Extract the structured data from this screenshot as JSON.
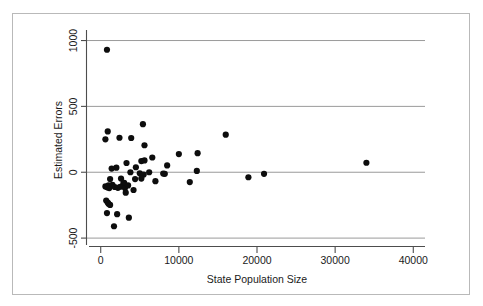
{
  "chart_data": {
    "type": "scatter",
    "title": "",
    "xlabel": "State Population Size",
    "ylabel": "Estimated Errors",
    "xlim": [
      -1500,
      41500
    ],
    "ylim": [
      -560,
      1080
    ],
    "xticks": [
      0,
      10000,
      20000,
      30000,
      40000
    ],
    "xtick_labels": [
      "0",
      "10000",
      "20000",
      "30000",
      "40000"
    ],
    "yticks": [
      -500,
      0,
      500,
      1000
    ],
    "ytick_labels": [
      "-500",
      "0",
      "500",
      "1000"
    ],
    "grid": "horizontal",
    "gridlines": [
      -500,
      0,
      500,
      1000
    ],
    "legend": "none",
    "marker": "filled-circle",
    "marker_color": "#0d0d0d",
    "points": [
      {
        "x": 800,
        "y": 930
      },
      {
        "x": 900,
        "y": 310
      },
      {
        "x": 600,
        "y": 250
      },
      {
        "x": 2400,
        "y": 262
      },
      {
        "x": 3900,
        "y": 260
      },
      {
        "x": 5400,
        "y": 365
      },
      {
        "x": 5600,
        "y": 205
      },
      {
        "x": 16000,
        "y": 285
      },
      {
        "x": 34000,
        "y": 72
      },
      {
        "x": 10000,
        "y": 138
      },
      {
        "x": 12400,
        "y": 145
      },
      {
        "x": 6600,
        "y": 112
      },
      {
        "x": 5600,
        "y": 90
      },
      {
        "x": 5200,
        "y": 85
      },
      {
        "x": 8500,
        "y": 52
      },
      {
        "x": 2000,
        "y": 35
      },
      {
        "x": 3300,
        "y": 70
      },
      {
        "x": 4500,
        "y": 38
      },
      {
        "x": 1400,
        "y": 28
      },
      {
        "x": 12300,
        "y": 10
      },
      {
        "x": 3800,
        "y": 0
      },
      {
        "x": 6200,
        "y": 0
      },
      {
        "x": 5000,
        "y": -8
      },
      {
        "x": 8200,
        "y": -12
      },
      {
        "x": 8000,
        "y": -10
      },
      {
        "x": 5500,
        "y": -18
      },
      {
        "x": 20900,
        "y": -12
      },
      {
        "x": 18900,
        "y": -38
      },
      {
        "x": 5200,
        "y": -48
      },
      {
        "x": 1200,
        "y": -52
      },
      {
        "x": 2600,
        "y": -48
      },
      {
        "x": 4400,
        "y": -52
      },
      {
        "x": 7000,
        "y": -68
      },
      {
        "x": 11400,
        "y": -75
      },
      {
        "x": 3000,
        "y": -80
      },
      {
        "x": 2900,
        "y": -85
      },
      {
        "x": 600,
        "y": -108
      },
      {
        "x": 800,
        "y": -112
      },
      {
        "x": 900,
        "y": -115
      },
      {
        "x": 1000,
        "y": -100
      },
      {
        "x": 1100,
        "y": -120
      },
      {
        "x": 1500,
        "y": -95
      },
      {
        "x": 1800,
        "y": -112
      },
      {
        "x": 2200,
        "y": -118
      },
      {
        "x": 2500,
        "y": -110
      },
      {
        "x": 3100,
        "y": -120
      },
      {
        "x": 3500,
        "y": -100
      },
      {
        "x": 4200,
        "y": -135
      },
      {
        "x": 3200,
        "y": -155
      },
      {
        "x": 700,
        "y": -215
      },
      {
        "x": 900,
        "y": -230
      },
      {
        "x": 1000,
        "y": -240
      },
      {
        "x": 1200,
        "y": -248
      },
      {
        "x": 800,
        "y": -310
      },
      {
        "x": 2100,
        "y": -318
      },
      {
        "x": 3600,
        "y": -345
      },
      {
        "x": 1700,
        "y": -410
      }
    ]
  },
  "axes": {
    "xlabel": "State Population Size",
    "ylabel": "Estimated Errors",
    "xtick_labels": [
      "0",
      "10000",
      "20000",
      "30000",
      "40000"
    ],
    "ytick_labels": [
      "1000",
      "500",
      "0",
      "-500"
    ]
  }
}
